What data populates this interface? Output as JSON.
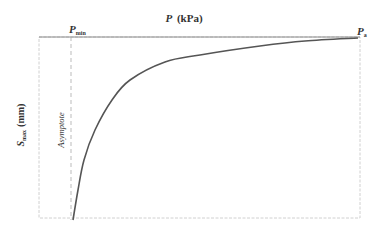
{
  "chart_data": {
    "type": "line",
    "title": "",
    "xlabel": "P (kPa)",
    "xlabel_parts": {
      "symbol": "P",
      "unit": "(kPa)"
    },
    "ylabel": "S_max (mm)",
    "ylabel_parts": {
      "symbol": "S",
      "subscript": "max",
      "unit": "(mm)"
    },
    "x_axis_position": "top",
    "grid": false,
    "legend": null,
    "annotations": [
      {
        "text": "P_min",
        "symbol": "P",
        "subscript": "min",
        "position": "top-axis, at asymptote"
      },
      {
        "text": "P_a",
        "symbol": "P",
        "subscript": "a",
        "position": "top-axis, right end"
      },
      {
        "text": "Asymptote",
        "orientation": "vertical",
        "position": "along dashed line at P_min"
      }
    ],
    "series": [
      {
        "name": "S_max vs P",
        "description": "Hyperbolic curve: S_max decreases in magnitude (plotted downward) toward vertical asymptote at P_min; approaches 0 at P_a",
        "x": [
          "P_min",
          "",
          "",
          "",
          "",
          "",
          "",
          "",
          "P_a"
        ],
        "pixel_points": [
          [
            73,
            220
          ],
          [
            78,
            190
          ],
          [
            84,
            160
          ],
          [
            95,
            130
          ],
          [
            112,
            100
          ],
          [
            130,
            80
          ],
          [
            165,
            62
          ],
          [
            200,
            55
          ],
          [
            260,
            46
          ],
          [
            305,
            41
          ],
          [
            358,
            38
          ]
        ]
      }
    ],
    "asymptote": {
      "x": "P_min",
      "style": "dashed vertical"
    },
    "xlim": [
      "",
      "P_a"
    ],
    "ylim": [
      "",
      ""
    ]
  },
  "colors": {
    "curve": "#555555",
    "axis": "#8a8a8a",
    "frame": "#bdbdbd",
    "asymptote": "#aaaaaa",
    "text": "#333333"
  }
}
